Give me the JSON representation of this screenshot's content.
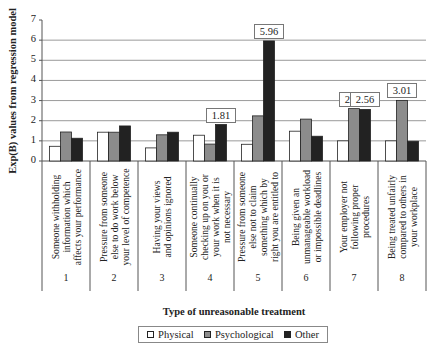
{
  "chart_data": {
    "type": "bar",
    "title": "",
    "ylabel": "Exp(B) values from regression model",
    "xlabel": "Type of unreasonable treatment",
    "ylim": [
      0,
      7
    ],
    "yticks": [
      0,
      1,
      2,
      3,
      4,
      5,
      6,
      7
    ],
    "grid": true,
    "legend_position": "bottom",
    "categories": [
      "1",
      "2",
      "3",
      "4",
      "5",
      "6",
      "7",
      "8"
    ],
    "category_descriptions": [
      "Someone withholding\ninformation which\naffects your performance",
      "Pressure from someone\nelse to do work below\nyour level of competence",
      "Having your views\nand opinions ignored",
      "Someone continually\nchecking up on you or\nyour work when it is\nnot necessary",
      "Pressure from someone\nelse not to claim\nsomething which by\nright you are entitled to",
      "Being given an\nunmanageable workload\nor impossible deadlines",
      "Your employer not\nfollowing proper\nprocedures",
      "Being treated unfairly\ncompared to others in\nyour workplace"
    ],
    "series": [
      {
        "name": "Physical",
        "color": "#ffffff",
        "values": [
          0.73,
          1.43,
          0.65,
          1.28,
          0.83,
          1.48,
          1.0,
          1.0
        ]
      },
      {
        "name": "Psychological",
        "color": "#8c8c8c",
        "values": [
          1.44,
          1.43,
          1.3,
          0.84,
          2.24,
          2.08,
          2.6,
          3.01
        ]
      },
      {
        "name": "Other",
        "color": "#222222",
        "values": [
          1.13,
          1.74,
          1.43,
          1.81,
          5.96,
          1.23,
          2.56,
          0.98
        ]
      }
    ],
    "annotations": [
      {
        "category": "4",
        "series": "Other",
        "text": "1.81"
      },
      {
        "category": "5",
        "series": "Other",
        "text": "5.96"
      },
      {
        "category": "7",
        "series": "Psychological",
        "text": "2.60"
      },
      {
        "category": "7",
        "series": "Other",
        "text": "2.56"
      },
      {
        "category": "8",
        "series": "Psychological",
        "text": "3.01"
      }
    ]
  },
  "legend": {
    "items": [
      {
        "label": "Physical",
        "color": "#ffffff"
      },
      {
        "label": "Psychological",
        "color": "#8c8c8c"
      },
      {
        "label": "Other",
        "color": "#222222"
      }
    ]
  }
}
